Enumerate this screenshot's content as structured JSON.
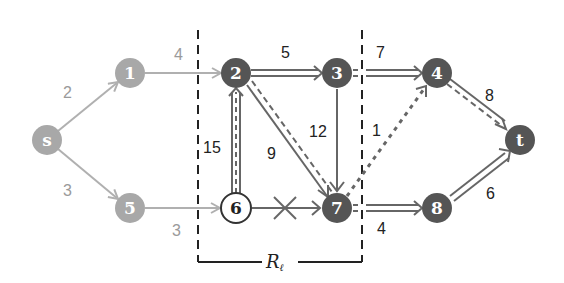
{
  "colors": {
    "light_node": "#a8a8a8",
    "dark_node": "#555555",
    "light_edge": "#b0b0b0",
    "dark_edge": "#666666",
    "light_label": "#9a9a9a",
    "dark_label": "#222222",
    "boundary": "#222222"
  },
  "nodes": [
    {
      "id": "s",
      "label": "s",
      "x": 47,
      "y": 140,
      "style": "light"
    },
    {
      "id": "1",
      "label": "1",
      "x": 130,
      "y": 73,
      "style": "light"
    },
    {
      "id": "2",
      "label": "2",
      "x": 236,
      "y": 73,
      "style": "dark"
    },
    {
      "id": "3",
      "label": "3",
      "x": 337,
      "y": 73,
      "style": "dark"
    },
    {
      "id": "4",
      "label": "4",
      "x": 437,
      "y": 73,
      "style": "dark"
    },
    {
      "id": "t",
      "label": "t",
      "x": 520,
      "y": 140,
      "style": "dark"
    },
    {
      "id": "5",
      "label": "5",
      "x": 130,
      "y": 208,
      "style": "light"
    },
    {
      "id": "6",
      "label": "6",
      "x": 236,
      "y": 208,
      "style": "outline"
    },
    {
      "id": "7",
      "label": "7",
      "x": 337,
      "y": 208,
      "style": "dark"
    },
    {
      "id": "8",
      "label": "8",
      "x": 437,
      "y": 208,
      "style": "dark"
    }
  ],
  "edges": [
    {
      "from": "s",
      "to": "1",
      "weight": "2",
      "style": "light",
      "label_x": 68,
      "label_y": 95
    },
    {
      "from": "s",
      "to": "5",
      "weight": "3",
      "style": "light",
      "label_x": 68,
      "label_y": 192
    },
    {
      "from": "1",
      "to": "2",
      "weight": "4",
      "style": "light",
      "label_x": 179,
      "label_y": 60
    },
    {
      "from": "5",
      "to": "6",
      "weight": "3",
      "style": "light",
      "label_x": 177,
      "label_y": 234
    },
    {
      "from": "2",
      "to": "3",
      "weight": "5",
      "style": "double",
      "label_x": 286,
      "label_y": 58
    },
    {
      "from": "3",
      "to": "4",
      "weight": "7",
      "style": "double",
      "label_x": 380,
      "label_y": 58
    },
    {
      "from": "3",
      "to": "7",
      "weight": "12",
      "style": "solid",
      "label_x": 316,
      "label_y": 135
    },
    {
      "from": "2",
      "to": "7",
      "weight": "9",
      "style": "solid-dashed",
      "label_x": 272,
      "label_y": 157
    },
    {
      "from": "6",
      "to": "2",
      "weight": "15",
      "style": "double-dashed",
      "label_x": 212,
      "label_y": 152
    },
    {
      "from": "6",
      "to": "7",
      "weight": "",
      "style": "crossed",
      "label_x": 0,
      "label_y": 0
    },
    {
      "from": "7",
      "to": "4",
      "weight": "1",
      "style": "dotted",
      "label_x": 376,
      "label_y": 132
    },
    {
      "from": "7",
      "to": "8",
      "weight": "4",
      "style": "double",
      "label_x": 382,
      "label_y": 232
    },
    {
      "from": "4",
      "to": "t",
      "weight": "8",
      "style": "solid-dashed",
      "label_x": 489,
      "label_y": 100
    },
    {
      "from": "8",
      "to": "t",
      "weight": "6",
      "style": "double",
      "label_x": 490,
      "label_y": 195
    }
  ],
  "region": {
    "label": "R",
    "subscript": "ℓ",
    "left_x": 198,
    "right_x": 362,
    "top_y": 30,
    "bottom_y": 262
  }
}
